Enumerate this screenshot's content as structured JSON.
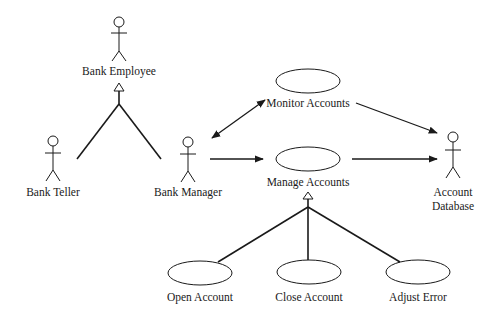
{
  "diagram": {
    "type": "UML use case diagram",
    "colors": {
      "stroke": "#1a1a1a",
      "background": "#ffffff"
    },
    "actors": [
      {
        "id": "bank_employee",
        "label": "Bank Employee",
        "x": 119,
        "y": 22
      },
      {
        "id": "bank_teller",
        "label": "Bank Teller",
        "x": 53,
        "y": 141
      },
      {
        "id": "bank_manager",
        "label": "Bank Manager",
        "x": 188,
        "y": 142
      },
      {
        "id": "account_database",
        "label_line1": "Account",
        "label_line2": "Database",
        "x": 453,
        "y": 137
      }
    ],
    "use_cases": [
      {
        "id": "monitor_accounts",
        "label": "Monitor Accounts",
        "cx": 308,
        "cy": 81
      },
      {
        "id": "manage_accounts",
        "label": "Manage Accounts",
        "cx": 308,
        "cy": 159
      },
      {
        "id": "open_account",
        "label": "Open Account",
        "cx": 200,
        "cy": 273
      },
      {
        "id": "close_account",
        "label": "Close Account",
        "cx": 309,
        "cy": 272
      },
      {
        "id": "adjust_error",
        "label": "Adjust Error",
        "cx": 418,
        "cy": 272
      }
    ],
    "relationships": [
      {
        "type": "generalization",
        "from": [
          "bank_teller",
          "bank_manager"
        ],
        "to": "bank_employee"
      },
      {
        "type": "association-bidirectional",
        "from": "bank_manager",
        "to": "monitor_accounts"
      },
      {
        "type": "association",
        "from": "bank_manager",
        "to": "manage_accounts"
      },
      {
        "type": "association",
        "from": "monitor_accounts",
        "to": "account_database"
      },
      {
        "type": "association",
        "from": "manage_accounts",
        "to": "account_database"
      },
      {
        "type": "generalization",
        "from": [
          "open_account",
          "close_account",
          "adjust_error"
        ],
        "to": "manage_accounts"
      }
    ]
  }
}
